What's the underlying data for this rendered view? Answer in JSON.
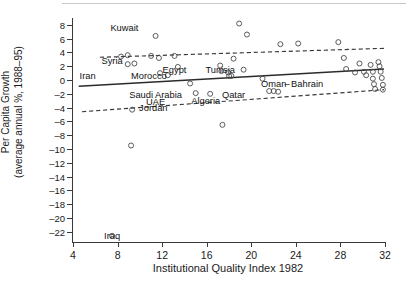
{
  "chart_data": {
    "type": "scatter",
    "title": "",
    "xlabel": "Institutional Quality Index 1982",
    "ylabel_line1": "Per Capita Growth",
    "ylabel_line2": "(average annual %, 1988–95)",
    "xlim": [
      4,
      32
    ],
    "ylim": [
      -23.5,
      9.0
    ],
    "xticks": [
      4,
      8,
      12,
      16,
      20,
      24,
      28,
      32
    ],
    "yticks": [
      8,
      6,
      4,
      2,
      0,
      -2,
      -4,
      -6,
      -8,
      -10,
      -12,
      -14,
      -16,
      -18,
      -20,
      -22
    ],
    "grid": false,
    "legend": "none",
    "series": [
      {
        "name": "Countries",
        "marker": "open-circle",
        "points": [
          {
            "x": 8.4,
            "y": 3.4
          },
          {
            "x": 9.0,
            "y": 3.6
          },
          {
            "x": 9.0,
            "y": 2.3
          },
          {
            "x": 9.6,
            "y": 2.4
          },
          {
            "x": 11.1,
            "y": 3.5
          },
          {
            "x": 11.5,
            "y": 6.4
          },
          {
            "x": 11.8,
            "y": 3.2
          },
          {
            "x": 11.9,
            "y": 1.0
          },
          {
            "x": 12.6,
            "y": 0.7
          },
          {
            "x": 13.2,
            "y": 3.5
          },
          {
            "x": 13.5,
            "y": 1.9
          },
          {
            "x": 14.6,
            "y": -0.5
          },
          {
            "x": 15.1,
            "y": -1.9
          },
          {
            "x": 16.4,
            "y": -2.0
          },
          {
            "x": 17.3,
            "y": 2.1
          },
          {
            "x": 17.4,
            "y": 1.3
          },
          {
            "x": 17.5,
            "y": -6.5
          },
          {
            "x": 18.0,
            "y": 1.1
          },
          {
            "x": 18.1,
            "y": 0.6
          },
          {
            "x": 18.3,
            "y": 0.6
          },
          {
            "x": 18.5,
            "y": 3.1
          },
          {
            "x": 19.0,
            "y": 8.2
          },
          {
            "x": 19.4,
            "y": 1.5
          },
          {
            "x": 19.7,
            "y": 6.6
          },
          {
            "x": 21.1,
            "y": 0.2
          },
          {
            "x": 21.7,
            "y": -1.6
          },
          {
            "x": 22.1,
            "y": -1.6
          },
          {
            "x": 22.5,
            "y": -1.7
          },
          {
            "x": 22.7,
            "y": 5.2
          },
          {
            "x": 24.3,
            "y": 5.3
          },
          {
            "x": 27.9,
            "y": 5.5
          },
          {
            "x": 28.4,
            "y": 3.2
          },
          {
            "x": 28.6,
            "y": 1.6
          },
          {
            "x": 29.4,
            "y": 1.1
          },
          {
            "x": 29.8,
            "y": 2.4
          },
          {
            "x": 30.2,
            "y": 1.2
          },
          {
            "x": 30.4,
            "y": 0.7
          },
          {
            "x": 30.8,
            "y": 2.2
          },
          {
            "x": 31.0,
            "y": 1.2
          },
          {
            "x": 31.0,
            "y": 0.2
          },
          {
            "x": 31.1,
            "y": -0.6
          },
          {
            "x": 31.2,
            "y": -1.3
          },
          {
            "x": 31.5,
            "y": 2.6
          },
          {
            "x": 31.6,
            "y": 2.0
          },
          {
            "x": 31.7,
            "y": 1.2
          },
          {
            "x": 31.8,
            "y": 0.3
          },
          {
            "x": 31.9,
            "y": -0.7
          },
          {
            "x": 31.9,
            "y": -1.4
          },
          {
            "x": 9.3,
            "y": -9.5
          },
          {
            "x": 9.4,
            "y": -4.3
          },
          {
            "x": 7.6,
            "y": -22.6
          }
        ]
      }
    ],
    "fit_line": {
      "name": "regression line",
      "x_start": 4.6,
      "y_start": -0.9,
      "x_end": 32.0,
      "y_end": 1.6
    },
    "confidence_bands": [
      {
        "name": "upper",
        "x_start": 6.5,
        "y_start": 3.3,
        "x_end": 32.0,
        "y_end": 4.6
      },
      {
        "name": "lower",
        "x_start": 4.9,
        "y_start": -4.6,
        "x_end": 32.0,
        "y_end": -1.4
      }
    ],
    "annotations": [
      {
        "label": "Kuwait",
        "x": 8.7,
        "y": 7.5
      },
      {
        "label": "Syria",
        "x": 7.6,
        "y": 2.8
      },
      {
        "label": "Iran",
        "x": 5.4,
        "y": 0.6
      },
      {
        "label": "Morocco",
        "x": 10.9,
        "y": 0.6
      },
      {
        "label": "Egypt",
        "x": 13.2,
        "y": 1.5
      },
      {
        "label": "Tunisia",
        "x": 17.3,
        "y": 1.4
      },
      {
        "label": "Oman",
        "x": 22.1,
        "y": -0.6
      },
      {
        "label": "–",
        "x": 23.3,
        "y": -0.6
      },
      {
        "label": "Bahrain",
        "x": 25.1,
        "y": -0.6
      },
      {
        "label": "Saudi Arabia",
        "x": 11.5,
        "y": -2.2
      },
      {
        "label": "UAE",
        "x": 11.5,
        "y": -3.2
      },
      {
        "label": "Jordan",
        "x": 11.3,
        "y": -4.1
      },
      {
        "label": "Algeria",
        "x": 16.0,
        "y": -3.1
      },
      {
        "label": "Qatar",
        "x": 18.5,
        "y": -2.2
      },
      {
        "label": "Iraq",
        "x": 7.6,
        "y": -22.7
      }
    ]
  }
}
